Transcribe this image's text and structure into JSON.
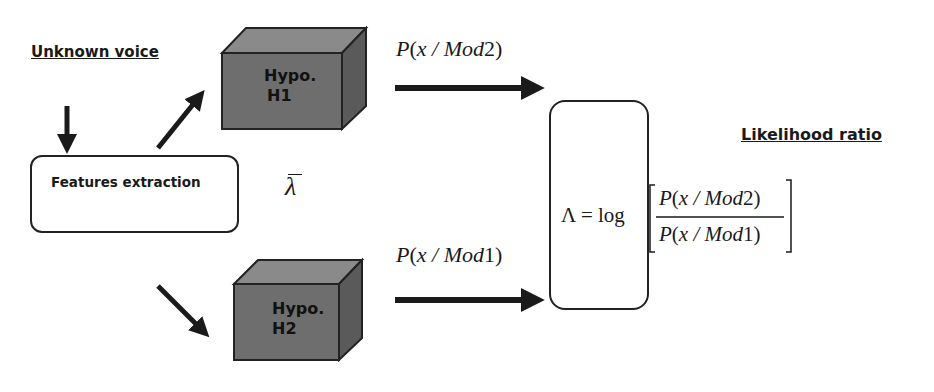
{
  "labels": {
    "input": "Unknown voice",
    "output": "Likelihood ratio"
  },
  "nodes": {
    "features": "Features extraction",
    "hypo1": {
      "line1": "Hypo.",
      "line2": "H1"
    },
    "hypo2": {
      "line1": "Hypo.",
      "line2": "H2"
    },
    "lambda_bar": "λ"
  },
  "edges": {
    "top": {
      "P": "P",
      "open": "(",
      "x": "x",
      "slash": " / ",
      "mod": "Mod",
      "idx": "2",
      "close": ")"
    },
    "bottom": {
      "P": "P",
      "open": "(",
      "x": "x",
      "slash": " / ",
      "mod": "Mod",
      "idx": "1",
      "close": ")"
    }
  },
  "formula": {
    "lhs": "Λ = log",
    "numerator": {
      "P": "P",
      "open": "(",
      "x": "x",
      "slash": " / ",
      "mod": "Mod",
      "idx": "2",
      "close": ")"
    },
    "denominator": {
      "P": "P",
      "open": "(",
      "x": "x",
      "slash": " / ",
      "mod": "Mod",
      "idx": "1",
      "close": ")"
    }
  },
  "colors": {
    "cube_front": "#6e6e6e",
    "cube_top": "#8a8a8a",
    "cube_side": "#5a5a5a",
    "stroke": "#1a1a1a"
  }
}
